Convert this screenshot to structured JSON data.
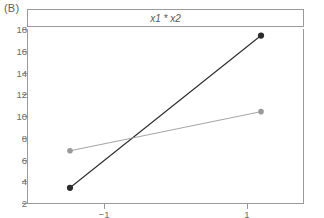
{
  "panel": {
    "label": "(B)"
  },
  "strip": {
    "title": "x1 * x2"
  },
  "axes": {
    "y_ticks": [
      "18",
      "16",
      "14",
      "12",
      "10",
      "8",
      "6",
      "4",
      "2"
    ],
    "x_ticks": [
      "−1",
      "1"
    ]
  },
  "colors": {
    "frame": "#9a9a9a",
    "text": "#6e6e6e",
    "series_dark": "#2b2b2b",
    "series_light": "#9a9a9a",
    "background": "#ffffff"
  },
  "chart_data": {
    "type": "line",
    "title": "x1 * x2",
    "subtitle": "(B)",
    "xlabel": "",
    "ylabel": "",
    "x": [
      -1,
      1
    ],
    "x_tick_labels": [
      "−1",
      "1"
    ],
    "y_ticks": [
      2,
      4,
      6,
      8,
      10,
      12,
      14,
      16,
      18
    ],
    "xlim": [
      -1.45,
      1.45
    ],
    "ylim": [
      2,
      18
    ],
    "grid": false,
    "legend": "none",
    "series": [
      {
        "name": "x1 high",
        "color": "#2b2b2b",
        "marker": "filled-circle",
        "values": [
          3.4,
          17.4
        ]
      },
      {
        "name": "x1 low",
        "color": "#9a9a9a",
        "marker": "filled-circle",
        "values": [
          6.8,
          10.4
        ]
      }
    ],
    "annotations": [
      "interaction plot: lines cross, indicating x1 by x2 interaction"
    ]
  }
}
